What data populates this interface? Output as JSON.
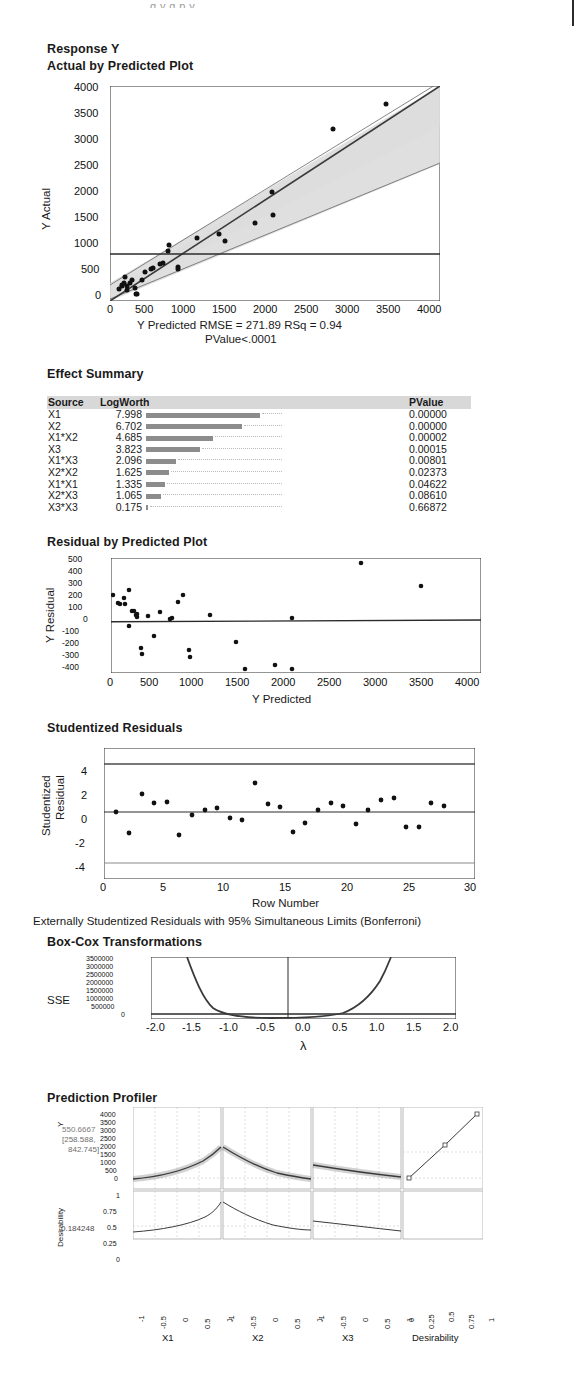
{
  "page": {
    "top_clip_text": "g y g p y",
    "background": "#ffffff"
  },
  "report": {
    "response_title": "Response Y",
    "sections": {
      "actual_by_predicted": "Actual by Predicted Plot",
      "effect_summary": "Effect Summary",
      "residual_by_predicted": "Residual by Predicted Plot",
      "studentized_residuals": "Studentized Residuals",
      "box_cox": "Box-Cox Transformations",
      "prediction_profiler": "Prediction Profiler"
    }
  },
  "actual_by_predicted": {
    "caption_line1": "Y Predicted RMSE = 271.89 RSq = 0.94",
    "caption_line2": "PValue<.0001",
    "ylabel": "Y Actual",
    "yticks": [
      "4000",
      "3500",
      "3000",
      "2500",
      "2000",
      "1500",
      "1000",
      "500",
      "0"
    ],
    "xticks": [
      "0",
      "500",
      "1000",
      "1500",
      "2000",
      "2500",
      "3000",
      "3500",
      "4000"
    ],
    "mean_line_value": 875
  },
  "effect_summary": {
    "columns": [
      "Source",
      "LogWorth",
      "PValue"
    ],
    "rows": [
      {
        "source": "X1",
        "logworth": "7.998",
        "pvalue": "0.00000",
        "bar": 7.998
      },
      {
        "source": "X2",
        "logworth": "6.702",
        "pvalue": "0.00000",
        "bar": 6.702
      },
      {
        "source": "X1*X2",
        "logworth": "4.685",
        "pvalue": "0.00002",
        "bar": 4.685
      },
      {
        "source": "X3",
        "logworth": "3.823",
        "pvalue": "0.00015",
        "bar": 3.823
      },
      {
        "source": "X1*X3",
        "logworth": "2.096",
        "pvalue": "0.00801",
        "bar": 2.096
      },
      {
        "source": "X2*X2",
        "logworth": "1.625",
        "pvalue": "0.02373",
        "bar": 1.625
      },
      {
        "source": "X1*X1",
        "logworth": "1.335",
        "pvalue": "0.04622",
        "bar": 1.335
      },
      {
        "source": "X2*X3",
        "logworth": "1.065",
        "pvalue": "0.08610",
        "bar": 1.065
      },
      {
        "source": "X3*X3",
        "logworth": "0.175",
        "pvalue": "0.66872",
        "bar": 0.175
      }
    ]
  },
  "residual_by_predicted": {
    "ylabel": "Y Residual",
    "xlabel": "Y Predicted",
    "yticks": [
      "500",
      "400",
      "300",
      "200",
      "100",
      "0",
      "-100",
      "-200",
      "-300",
      "-400"
    ],
    "xticks": [
      "0",
      "500",
      "1000",
      "1500",
      "2000",
      "2500",
      "3000",
      "3500",
      "4000"
    ]
  },
  "studentized_residuals": {
    "ylabel_line1": "Studentized",
    "ylabel_line2": "Residual",
    "xlabel": "Row Number",
    "yticks": [
      "4",
      "2",
      "0",
      "-2",
      "-4"
    ],
    "xticks": [
      "0",
      "5",
      "10",
      "15",
      "20",
      "25",
      "30"
    ],
    "footnote": "Externally Studentized Residuals with 95% Simultaneous Limits (Bonferroni)",
    "limit_upper": 3.75,
    "limit_lower": -3.75
  },
  "box_cox": {
    "ylabel": "SSE",
    "xlabel": "λ",
    "yticks": [
      "3500000",
      "3000000",
      "2500000",
      "2000000",
      "1500000",
      "1000000",
      "500000",
      "0"
    ],
    "xticks": [
      "-2.0",
      "-1.5",
      "-1.0",
      "-0.5",
      "0.0",
      "0.5",
      "1.0",
      "1.5",
      "2.0"
    ],
    "best_lambda": -0.2
  },
  "prediction_profiler": {
    "y_var": "Y",
    "y_value": "550.6667",
    "y_ci_line1": "[258.588,",
    "y_ci_line2": "842.745]",
    "desirability_label": "Desirability",
    "desirability_value": "0.184248",
    "y_ticks": [
      "4000",
      "3500",
      "3000",
      "2500",
      "2000",
      "1500",
      "1000",
      "500",
      "0"
    ],
    "desirability_ticks": [
      "1",
      "0.75",
      "0.5",
      "0.25",
      "0"
    ],
    "factors": [
      {
        "name": "X1",
        "ticks": [
          "-1",
          "-0.5",
          "0",
          "0.5",
          "1"
        ]
      },
      {
        "name": "X2",
        "ticks": [
          "-1",
          "-0.5",
          "0",
          "0.5",
          "1"
        ]
      },
      {
        "name": "X3",
        "ticks": [
          "-1",
          "-0.5",
          "0",
          "0.5",
          "1"
        ]
      }
    ],
    "desirability_axis": {
      "name": "Desirability",
      "ticks": [
        "0",
        "0.25",
        "0.5",
        "0.75",
        "1"
      ]
    }
  },
  "chart_data": [
    {
      "type": "scatter",
      "id": "actual-by-predicted",
      "title": "Actual by Predicted Plot",
      "xlabel": "Y Predicted",
      "ylabel": "Y Actual",
      "xlim": [
        0,
        4000
      ],
      "ylim": [
        0,
        4000
      ],
      "grid": false,
      "legend": null,
      "annotations": [
        "Y Predicted RMSE = 271.89 RSq = 0.94",
        "PValue<.0001"
      ],
      "fit_line": {
        "slope": 1,
        "intercept": 0
      },
      "mean_line": 875,
      "confidence_band": true,
      "points": [
        [
          110,
          230
        ],
        [
          140,
          290
        ],
        [
          150,
          300
        ],
        [
          170,
          340
        ],
        [
          185,
          455
        ],
        [
          200,
          275
        ],
        [
          210,
          210
        ],
        [
          245,
          340
        ],
        [
          265,
          400
        ],
        [
          300,
          245
        ],
        [
          315,
          120
        ],
        [
          330,
          125
        ],
        [
          390,
          400
        ],
        [
          430,
          540
        ],
        [
          500,
          600
        ],
        [
          520,
          620
        ],
        [
          600,
          690
        ],
        [
          640,
          715
        ],
        [
          700,
          930
        ],
        [
          720,
          1050
        ],
        [
          820,
          640
        ],
        [
          825,
          600
        ],
        [
          1060,
          1180
        ],
        [
          1320,
          1240
        ],
        [
          1400,
          1110
        ],
        [
          1760,
          1450
        ],
        [
          1960,
          2030
        ],
        [
          1975,
          1600
        ],
        [
          2700,
          3210
        ],
        [
          3350,
          3665
        ]
      ]
    },
    {
      "type": "bar",
      "id": "effect-summary",
      "title": "Effect Summary",
      "categories": [
        "X1",
        "X2",
        "X1*X2",
        "X3",
        "X1*X3",
        "X2*X2",
        "X1*X1",
        "X2*X3",
        "X3*X3"
      ],
      "values": [
        7.998,
        6.702,
        4.685,
        3.823,
        2.096,
        1.625,
        1.335,
        1.065,
        0.175
      ],
      "pvalues": [
        0.0,
        0.0,
        2e-05,
        0.00015,
        0.00801,
        0.02373,
        0.04622,
        0.0861,
        0.66872
      ],
      "xlabel": "LogWorth",
      "ylabel": "Source",
      "xlim": [
        0,
        8
      ]
    },
    {
      "type": "scatter",
      "id": "residual-by-predicted",
      "title": "Residual by Predicted Plot",
      "xlabel": "Y Predicted",
      "ylabel": "Y Residual",
      "xlim": [
        0,
        4000
      ],
      "ylim": [
        -400,
        500
      ],
      "zero_line": 0,
      "points": [
        [
          20,
          210
        ],
        [
          75,
          145
        ],
        [
          95,
          140
        ],
        [
          140,
          185
        ],
        [
          150,
          140
        ],
        [
          190,
          250
        ],
        [
          195,
          -35
        ],
        [
          230,
          85
        ],
        [
          250,
          80
        ],
        [
          270,
          55
        ],
        [
          280,
          40
        ],
        [
          285,
          60
        ],
        [
          320,
          -205
        ],
        [
          335,
          -250
        ],
        [
          400,
          45
        ],
        [
          470,
          -115
        ],
        [
          530,
          75
        ],
        [
          640,
          25
        ],
        [
          660,
          30
        ],
        [
          720,
          155
        ],
        [
          775,
          215
        ],
        [
          845,
          -220
        ],
        [
          850,
          -280
        ],
        [
          1070,
          60
        ],
        [
          1350,
          -160
        ],
        [
          1450,
          -375
        ],
        [
          1770,
          -340
        ],
        [
          1955,
          30
        ],
        [
          1960,
          -370
        ],
        [
          2705,
          480
        ],
        [
          3350,
          295
        ]
      ]
    },
    {
      "type": "scatter",
      "id": "studentized-residuals",
      "title": "Studentized Residuals",
      "xlabel": "Row Number",
      "ylabel": "Studentized Residual",
      "xlim": [
        0,
        30
      ],
      "ylim": [
        -5,
        5
      ],
      "limit_lines": [
        3.75,
        -3.75
      ],
      "zero_line": 0.15,
      "points": [
        [
          1,
          0.15
        ],
        [
          2,
          -1.6
        ],
        [
          3,
          1.6
        ],
        [
          4,
          0.9
        ],
        [
          5,
          1.0
        ],
        [
          6,
          -1.75
        ],
        [
          7,
          -0.1
        ],
        [
          8,
          0.25
        ],
        [
          9,
          0.4
        ],
        [
          10,
          -0.4
        ],
        [
          11,
          -0.55
        ],
        [
          12,
          2.55
        ],
        [
          13,
          0.7
        ],
        [
          14,
          0.45
        ],
        [
          15,
          -1.55
        ],
        [
          16,
          -0.8
        ],
        [
          17,
          0.25
        ],
        [
          18,
          0.85
        ],
        [
          19,
          0.55
        ],
        [
          20,
          -0.9
        ],
        [
          21,
          0.25
        ],
        [
          22,
          1.05
        ],
        [
          23,
          1.2
        ],
        [
          24,
          -1.15
        ],
        [
          25,
          -1.15
        ],
        [
          26,
          0.9
        ],
        [
          27,
          0.65
        ]
      ]
    },
    {
      "type": "line",
      "id": "box-cox",
      "title": "Box-Cox Transformations",
      "xlabel": "λ",
      "ylabel": "SSE",
      "xlim": [
        -2.0,
        2.0
      ],
      "ylim": [
        0,
        3500000
      ],
      "best_lambda": -0.2,
      "x": [
        -2.0,
        -1.75,
        -1.5,
        -1.25,
        -1.0,
        -0.75,
        -0.5,
        -0.25,
        0.0,
        0.25,
        0.5,
        0.75,
        1.0,
        1.25,
        1.5,
        1.75,
        2.0
      ],
      "values": [
        9000000,
        6000000,
        3500000,
        1700000,
        800000,
        400000,
        250000,
        230000,
        255000,
        300000,
        420000,
        700000,
        1300000,
        3400000,
        8000000,
        16000000,
        30000000
      ]
    },
    {
      "type": "line",
      "id": "prediction-profiler",
      "title": "Prediction Profiler",
      "y_value": 550.6667,
      "y_ci": [
        258.588,
        842.745
      ],
      "desirability": 0.184248,
      "panels": [
        {
          "factor": "X1",
          "setting": 1,
          "y_at_low": 180,
          "y_at_high": 1430,
          "desir_low": 0.1,
          "desir_high": 0.4
        },
        {
          "factor": "X2",
          "setting": -1,
          "y_at_low": 1430,
          "y_at_high": 290,
          "desir_low": 0.4,
          "desir_high": 0.15
        },
        {
          "factor": "X3",
          "setting": -1,
          "y_at_low": 760,
          "y_at_high": 430,
          "desir_low": 0.25,
          "desir_high": 0.14
        }
      ],
      "desirability_function": {
        "x": [
          0,
          0.5,
          1
        ],
        "y": [
          0.05,
          0.55,
          0.98
        ]
      }
    }
  ]
}
